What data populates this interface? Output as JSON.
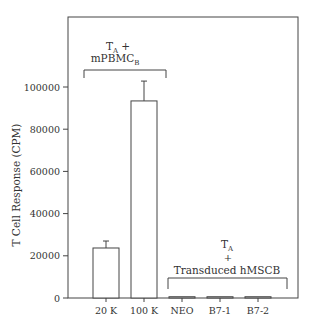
{
  "chart_data": {
    "type": "bar",
    "title": "",
    "xlabel": "",
    "ylabel": "T Cell Response (CPM)",
    "ylim": [
      0,
      120000
    ],
    "yticks": [
      0,
      20000,
      40000,
      60000,
      80000,
      100000
    ],
    "ytick_labels": [
      "0",
      "20000",
      "40000",
      "60000",
      "80000",
      "100000"
    ],
    "categories": [
      "20 K",
      "100 K",
      "NEO",
      "B7-1",
      "B7-2"
    ],
    "values": [
      23700,
      93400,
      600,
      600,
      600
    ],
    "errors": [
      3300,
      9400,
      0,
      0,
      0
    ],
    "grid": false,
    "annotations": [
      {
        "group": "left",
        "lines": [
          "T_A +",
          "mPBMC_B"
        ],
        "label_main1": "T",
        "label_sub1": "A",
        "label_rest1": " +",
        "label_main2": "mPBMC",
        "label_sub2": "B",
        "covers": [
          "20 K",
          "100 K"
        ]
      },
      {
        "group": "right",
        "lines": [
          "T_A",
          "+",
          "Transduced hMSCB"
        ],
        "label_main1": "T",
        "label_sub1": "A",
        "label_plus": "+",
        "label_line3": "Transduced hMSCB",
        "covers": [
          "NEO",
          "B7-1",
          "B7-2"
        ]
      }
    ]
  }
}
